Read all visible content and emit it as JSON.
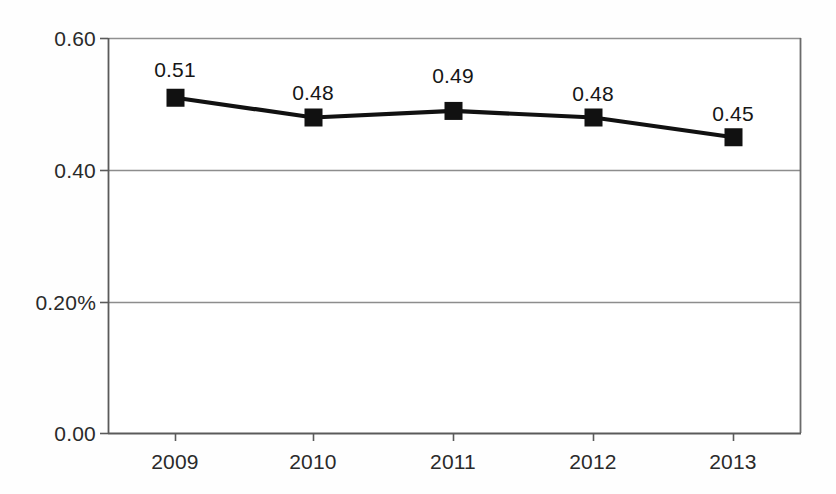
{
  "chart_data": {
    "type": "line",
    "title": "",
    "subtitle": "",
    "xlabel": "",
    "ylabel": "",
    "categories": [
      "2009",
      "2010",
      "2011",
      "2012",
      "2013"
    ],
    "values": [
      0.51,
      0.48,
      0.49,
      0.48,
      0.45
    ],
    "point_labels": [
      "0.51",
      "0.48",
      "0.49",
      "0.48",
      "0.45"
    ],
    "series": [
      {
        "name": "",
        "values": [
          0.51,
          0.48,
          0.49,
          0.48,
          0.45
        ],
        "marker": "filled-square",
        "color": "#111111"
      }
    ],
    "ylim": [
      0.0,
      0.6
    ],
    "y_ticks": [
      0.0,
      0.2,
      0.4,
      0.6
    ],
    "y_tick_labels": [
      "0.00",
      "0.20%",
      "0.40",
      "0.60"
    ],
    "x_tick_labels": [
      "2009",
      "2010",
      "2011",
      "2012",
      "2013"
    ],
    "grid": "horizontal",
    "gridlines_at": [
      0.2,
      0.4,
      0.6
    ],
    "legend": "none",
    "legend_position": "none",
    "annotations": []
  },
  "colors": {
    "line": "#111111",
    "marker": "#111111",
    "grid": "#808080",
    "axis": "#555555",
    "text": "#222222",
    "background": "#fefefe"
  },
  "axes": {
    "y_labels": [
      {
        "text": "0.60",
        "value": 0.6
      },
      {
        "text": "0.40",
        "value": 0.4
      },
      {
        "text": "0.20%",
        "value": 0.2
      },
      {
        "text": "0.00",
        "value": 0.0
      }
    ],
    "x_labels": [
      {
        "text": "2009"
      },
      {
        "text": "2010"
      },
      {
        "text": "2011"
      },
      {
        "text": "2012"
      },
      {
        "text": "2013"
      }
    ]
  }
}
